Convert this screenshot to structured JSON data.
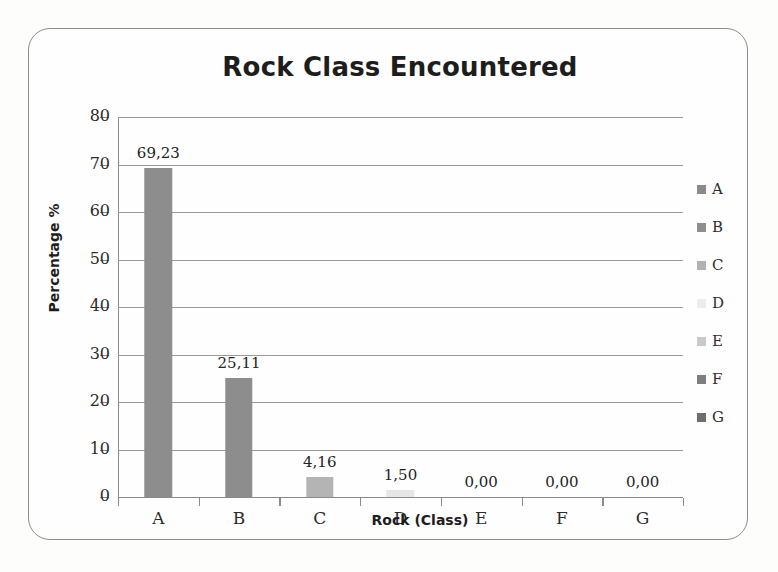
{
  "chart_data": {
    "type": "bar",
    "title": "Rock Class Encountered",
    "xlabel": "Rock (Class)",
    "ylabel": "Percentage %",
    "categories": [
      "A",
      "B",
      "C",
      "D",
      "E",
      "F",
      "G"
    ],
    "values": [
      69.23,
      25.11,
      4.16,
      1.5,
      0.0,
      0.0,
      0.0
    ],
    "value_labels": [
      "69,23",
      "25,11",
      "4,16",
      "1,50",
      "0,00",
      "0,00",
      "0,00"
    ],
    "ylim": [
      0,
      80
    ],
    "ytick_labels": [
      "80",
      "70",
      "60",
      "50",
      "40",
      "30",
      "20",
      "10",
      "0"
    ],
    "ytick_values": [
      80,
      70,
      60,
      50,
      40,
      30,
      20,
      10,
      0
    ],
    "grid": true,
    "legend_position": "right",
    "legend": [
      {
        "label": "A",
        "color": "#8a8a8a"
      },
      {
        "label": "B",
        "color": "#8e8e8e"
      },
      {
        "label": "C",
        "color": "#b2b2b2"
      },
      {
        "label": "D",
        "color": "#ececec"
      },
      {
        "label": "E",
        "color": "#c9c9c9"
      },
      {
        "label": "F",
        "color": "#7e7e7e"
      },
      {
        "label": "G",
        "color": "#6e6e6e"
      }
    ],
    "bar_colors": [
      "#8d8d8d",
      "#8d8d8d",
      "#b4b4b4",
      "#e6e6e6",
      "#c9c9c9",
      "#7e7e7e",
      "#6e6e6e"
    ]
  }
}
